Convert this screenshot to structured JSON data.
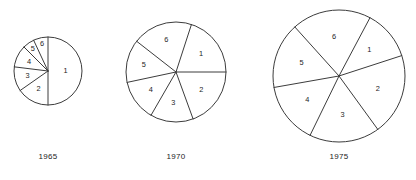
{
  "chart_data": {
    "type": "pie",
    "title": "",
    "xlabel": "",
    "ylabel": "",
    "legend_position": "none",
    "grid": false,
    "note": "Three proportional pie charts of increasing radius, each divided into six numbered sectors labelled 1-6. Sector sizes given in degrees; values are the implied share of the whole.",
    "charts": [
      {
        "caption": "1965",
        "center_x": 48,
        "center_y": 71,
        "radius": 34,
        "labels": [
          "1",
          "2",
          "3",
          "4",
          "5",
          "6"
        ],
        "angles_deg": [
          180,
          55,
          42,
          38,
          20,
          25
        ],
        "values_pct": [
          50.0,
          15.3,
          11.7,
          10.6,
          5.6,
          6.9
        ],
        "start_angle_deg": 0,
        "label_radius_frac": [
          0.52,
          0.6,
          0.62,
          0.62,
          0.78,
          0.82
        ]
      },
      {
        "caption": "1970",
        "center_x": 176,
        "center_y": 72,
        "radius": 50,
        "labels": [
          "1",
          "2",
          "3",
          "4",
          "5",
          "6"
        ],
        "angles_deg": [
          72,
          70,
          50,
          48,
          50,
          70
        ],
        "values_pct": [
          20.0,
          19.4,
          13.9,
          13.3,
          13.9,
          19.4
        ],
        "start_angle_deg": 18,
        "label_radius_frac": [
          0.62,
          0.62,
          0.62,
          0.62,
          0.66,
          0.66
        ]
      },
      {
        "caption": "1975",
        "center_x": 339,
        "center_y": 76,
        "radius": 66,
        "labels": [
          "1",
          "2",
          "3",
          "4",
          "5",
          "6"
        ],
        "angles_deg": [
          44,
          72,
          62,
          54,
          58,
          70
        ],
        "values_pct": [
          12.2,
          20.0,
          17.2,
          15.0,
          16.1,
          19.5
        ],
        "start_angle_deg": 28,
        "label_radius_frac": [
          0.6,
          0.62,
          0.6,
          0.6,
          0.6,
          0.6
        ]
      }
    ]
  },
  "captions": {
    "chart1": "1965",
    "chart2": "1970",
    "chart3": "1975"
  },
  "style": {
    "stroke_color": "#3c3c3c",
    "fill_color": "#ffffff",
    "text_color": "#1c1c1c",
    "background": "#ffffff"
  }
}
